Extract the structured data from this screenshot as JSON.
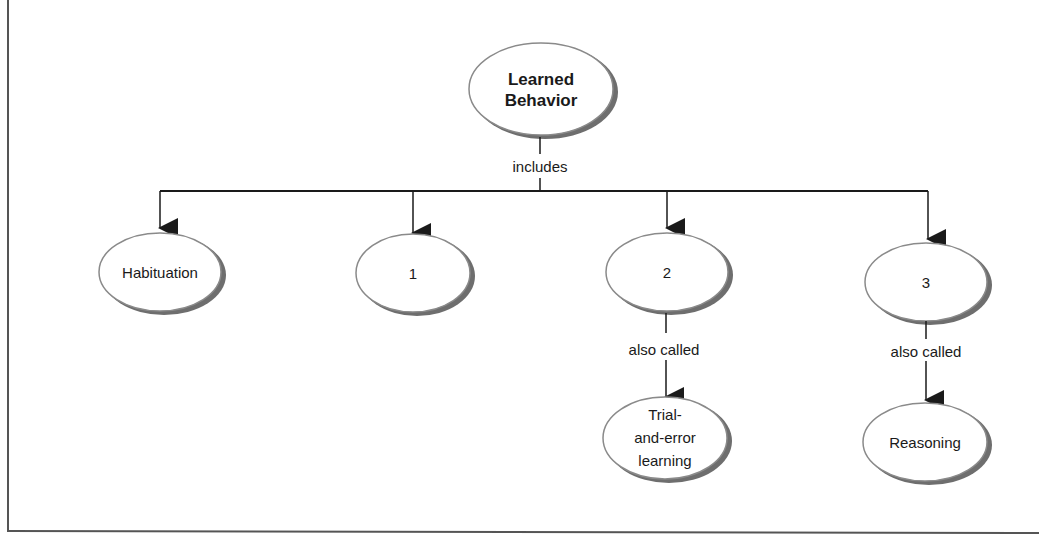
{
  "diagram": {
    "type": "concept-map",
    "colors": {
      "line": "#1a1a1a",
      "ellipse_stroke": "#7a7a7a",
      "ellipse_shadow": "#6e6e6e",
      "frame": "#555555",
      "text": "#1a1a1a"
    },
    "root": {
      "line1": "Learned",
      "line2": "Behavior"
    },
    "root_link": "includes",
    "children": [
      {
        "id": "habituation",
        "label": "Habituation"
      },
      {
        "id": "blank1",
        "label": "1"
      },
      {
        "id": "blank2",
        "label": "2",
        "link": "also called",
        "sub": {
          "line1": "Trial-",
          "line2": "and-error",
          "line3": "learning"
        }
      },
      {
        "id": "blank3",
        "label": "3",
        "link": "also called",
        "sub": {
          "line1": "Reasoning"
        }
      }
    ]
  }
}
